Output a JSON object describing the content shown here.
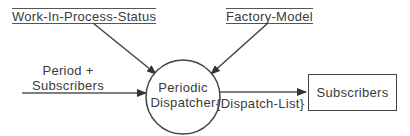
{
  "diagram": {
    "type": "data-flow-diagram",
    "process": {
      "label_line1": "Periodic",
      "label_line2": "Dispatcher"
    },
    "data_stores": [
      {
        "label": "Work-In-Process-Status"
      },
      {
        "label": "Factory-Model"
      }
    ],
    "external_entity": {
      "label": "Subscribers"
    },
    "flows": [
      {
        "from": "Work-In-Process-Status",
        "to": "Periodic Dispatcher",
        "label": ""
      },
      {
        "from": "Factory-Model",
        "to": "Periodic Dispatcher",
        "label": ""
      },
      {
        "from": "external",
        "to": "Periodic Dispatcher",
        "label_line1": "Period +",
        "label_line2": "Subscribers"
      },
      {
        "from": "Periodic Dispatcher",
        "to": "Subscribers",
        "label": "{Dispatch-List}"
      }
    ],
    "colors": {
      "line": "#444444",
      "text": "#3a3a3a",
      "background": "#ffffff"
    }
  }
}
